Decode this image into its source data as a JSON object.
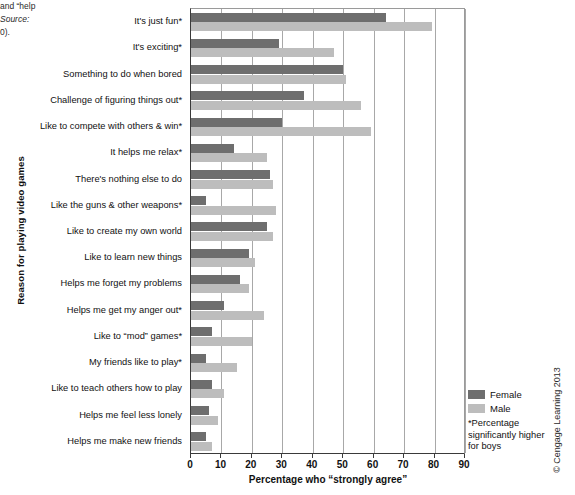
{
  "margin_scraps": {
    "line1": "and  “help",
    "line2": "Source:",
    "line3": "0)."
  },
  "chart_data": {
    "type": "bar",
    "orientation": "horizontal",
    "title": "",
    "xlabel": "Percentage who “strongly agree”",
    "ylabel": "Reason for playing video games",
    "xlim": [
      0,
      90
    ],
    "xticks": [
      0,
      10,
      20,
      30,
      40,
      50,
      60,
      70,
      80,
      90
    ],
    "grid": "vertical",
    "legend_position": "right",
    "categories": [
      "It's just fun*",
      "It's exciting*",
      "Something to do when bored",
      "Challenge of figuring things out*",
      "Like to compete with others & win*",
      "It helps me relax*",
      "There's nothing else to do",
      "Like the guns & other weapons*",
      "Like to create my own world",
      "Like to learn new things",
      "Helps me forget my problems",
      "Helps me get my anger out*",
      "Like to “mod” games*",
      "My friends like to play*",
      "Like to teach others how to play",
      "Helps me feel less lonely",
      "Helps me make new friends"
    ],
    "series": [
      {
        "name": "Female",
        "color": "#6e6e6e",
        "values": [
          64,
          29,
          50,
          37,
          30,
          14,
          26,
          5,
          25,
          19,
          16,
          11,
          7,
          5,
          7,
          6,
          5
        ]
      },
      {
        "name": "Male",
        "color": "#bdbdbd",
        "values": [
          79,
          47,
          51,
          56,
          59,
          25,
          27,
          28,
          27,
          21,
          19,
          24,
          20,
          15,
          11,
          9,
          7
        ]
      }
    ],
    "annotations": {
      "footnote": "*Percentage significantly higher for boys"
    }
  },
  "legend": {
    "items": [
      {
        "label": "Female",
        "swatch": "female"
      },
      {
        "label": "Male",
        "swatch": "male"
      }
    ],
    "note_line1": "*Percentage",
    "note_line2": "significantly higher",
    "note_line3": "for boys"
  },
  "copyright": "© Cengage Learning 2013"
}
